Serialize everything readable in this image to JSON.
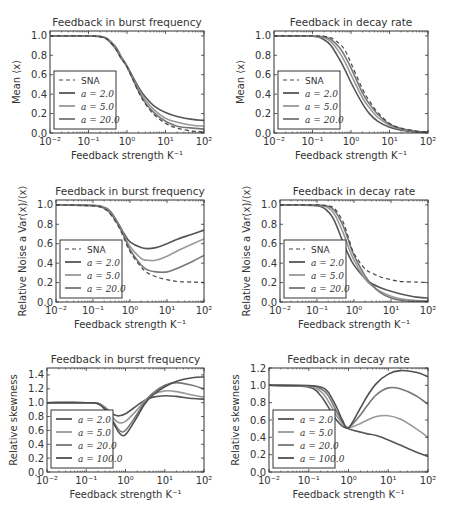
{
  "figure": {
    "width": 454,
    "height": 515,
    "colors": {
      "SNA": "#444444",
      "a2": "#555555",
      "a5": "#999999",
      "a20": "#777777",
      "a100": "#505050",
      "axis": "#333333"
    }
  },
  "chart_data": [
    {
      "id": "mean-burst",
      "type": "line",
      "title": "Feedback in burst frequency",
      "xlabel": "Feedback strength K⁻¹",
      "ylabel": "Mean ⟨x⟩",
      "xscale": "log",
      "xlim": [
        0.01,
        100
      ],
      "ylim": [
        0.0,
        1.05
      ],
      "xticks": [
        "10⁻²",
        "10⁻¹",
        "10⁰",
        "10¹",
        "10²"
      ],
      "yticks": [
        "0.0",
        "0.2",
        "0.4",
        "0.6",
        "0.8",
        "1.0"
      ],
      "legend": {
        "position": "lower left",
        "entries": [
          "SNA",
          "a = 2.0",
          "a = 5.0",
          "a = 20.0"
        ]
      },
      "x": [
        0.01,
        0.1,
        0.2,
        0.3,
        0.5,
        0.7,
        1,
        2,
        3,
        5,
        10,
        20,
        50,
        100
      ],
      "series": [
        {
          "name": "SNA",
          "style": "dashed",
          "values": [
            1.0,
            1.0,
            0.99,
            0.97,
            0.87,
            0.77,
            0.68,
            0.42,
            0.3,
            0.19,
            0.1,
            0.05,
            0.02,
            0.01
          ]
        },
        {
          "name": "a = 2.0",
          "style": "solid",
          "values": [
            1.0,
            1.0,
            0.995,
            0.975,
            0.89,
            0.79,
            0.69,
            0.47,
            0.37,
            0.28,
            0.21,
            0.17,
            0.14,
            0.13
          ]
        },
        {
          "name": "a = 5.0",
          "style": "solid",
          "values": [
            1.0,
            1.0,
            0.993,
            0.97,
            0.88,
            0.78,
            0.68,
            0.45,
            0.34,
            0.24,
            0.15,
            0.11,
            0.08,
            0.07
          ]
        },
        {
          "name": "a = 20.0",
          "style": "solid",
          "values": [
            1.0,
            1.0,
            0.99,
            0.965,
            0.87,
            0.77,
            0.68,
            0.43,
            0.31,
            0.21,
            0.12,
            0.07,
            0.05,
            0.04
          ]
        }
      ]
    },
    {
      "id": "mean-decay",
      "type": "line",
      "title": "Feedback in decay rate",
      "xlabel": "Feedback strength K⁻¹",
      "ylabel": "Mean ⟨x⟩",
      "xscale": "log",
      "xlim": [
        0.01,
        100
      ],
      "ylim": [
        0.0,
        1.05
      ],
      "xticks": [
        "10⁻²",
        "10⁻¹",
        "10⁰",
        "10¹",
        "10²"
      ],
      "yticks": [
        "0.0",
        "0.2",
        "0.4",
        "0.6",
        "0.8",
        "1.0"
      ],
      "legend": {
        "position": "lower left",
        "entries": [
          "SNA",
          "a = 2.0",
          "a = 5.0",
          "a = 20.0"
        ]
      },
      "x": [
        0.01,
        0.1,
        0.2,
        0.3,
        0.5,
        0.7,
        1,
        2,
        3,
        5,
        10,
        20,
        50,
        100
      ],
      "series": [
        {
          "name": "SNA",
          "style": "dashed",
          "values": [
            1.0,
            1.0,
            0.995,
            0.98,
            0.92,
            0.85,
            0.72,
            0.45,
            0.33,
            0.21,
            0.1,
            0.05,
            0.02,
            0.01
          ]
        },
        {
          "name": "a = 2.0",
          "style": "solid",
          "values": [
            1.0,
            0.995,
            0.96,
            0.9,
            0.76,
            0.65,
            0.52,
            0.3,
            0.2,
            0.12,
            0.06,
            0.03,
            0.01,
            0.005
          ]
        },
        {
          "name": "a = 5.0",
          "style": "solid",
          "values": [
            1.0,
            0.998,
            0.98,
            0.94,
            0.83,
            0.73,
            0.6,
            0.36,
            0.26,
            0.16,
            0.08,
            0.04,
            0.015,
            0.007
          ]
        },
        {
          "name": "a = 20.0",
          "style": "solid",
          "values": [
            1.0,
            0.999,
            0.99,
            0.965,
            0.88,
            0.79,
            0.67,
            0.41,
            0.3,
            0.19,
            0.09,
            0.045,
            0.018,
            0.008
          ]
        }
      ]
    },
    {
      "id": "noise-burst",
      "type": "line",
      "title": "Feedback in burst frequency",
      "xlabel": "Feedback strength K⁻¹",
      "ylabel": "Relative Noise a Var(x)/⟨x⟩",
      "xscale": "log",
      "xlim": [
        0.01,
        100
      ],
      "ylim": [
        0.0,
        1.05
      ],
      "xticks": [
        "10⁻²",
        "10⁻¹",
        "10⁰",
        "10¹",
        "10²"
      ],
      "yticks": [
        "0.0",
        "0.2",
        "0.4",
        "0.6",
        "0.8",
        "1.0"
      ],
      "legend": {
        "position": "lower left",
        "entries": [
          "SNA",
          "a = 2.0",
          "a = 5.0",
          "a = 20.0"
        ]
      },
      "x": [
        0.01,
        0.1,
        0.2,
        0.3,
        0.5,
        0.7,
        1,
        2,
        3,
        5,
        10,
        20,
        50,
        100
      ],
      "series": [
        {
          "name": "SNA",
          "style": "dashed",
          "values": [
            1.0,
            0.99,
            0.96,
            0.9,
            0.77,
            0.65,
            0.52,
            0.36,
            0.3,
            0.26,
            0.23,
            0.21,
            0.205,
            0.2
          ]
        },
        {
          "name": "a = 2.0",
          "style": "solid",
          "values": [
            1.0,
            0.995,
            0.975,
            0.93,
            0.8,
            0.7,
            0.62,
            0.56,
            0.55,
            0.56,
            0.6,
            0.65,
            0.7,
            0.74
          ]
        },
        {
          "name": "a = 5.0",
          "style": "solid",
          "values": [
            1.0,
            0.993,
            0.97,
            0.92,
            0.79,
            0.68,
            0.57,
            0.45,
            0.43,
            0.43,
            0.47,
            0.53,
            0.6,
            0.65
          ]
        },
        {
          "name": "a = 20.0",
          "style": "solid",
          "values": [
            1.0,
            0.99,
            0.965,
            0.91,
            0.78,
            0.67,
            0.54,
            0.38,
            0.33,
            0.31,
            0.31,
            0.35,
            0.42,
            0.48
          ]
        }
      ]
    },
    {
      "id": "noise-decay",
      "type": "line",
      "title": "Feedback in decay rate",
      "xlabel": "Feedback strength K⁻¹",
      "ylabel": "Relative Noise a Var(x)/⟨x⟩",
      "xscale": "log",
      "xlim": [
        0.01,
        100
      ],
      "ylim": [
        0.0,
        1.05
      ],
      "xticks": [
        "10⁻²",
        "10⁻¹",
        "10⁰",
        "10¹",
        "10²"
      ],
      "yticks": [
        "0.0",
        "0.2",
        "0.4",
        "0.6",
        "0.8",
        "1.0"
      ],
      "legend": {
        "position": "lower left",
        "entries": [
          "SNA",
          "a = 2.0",
          "a = 5.0",
          "a = 20.0"
        ]
      },
      "x": [
        0.01,
        0.1,
        0.2,
        0.3,
        0.5,
        0.7,
        1,
        2,
        3,
        5,
        10,
        20,
        50,
        100
      ],
      "series": [
        {
          "name": "SNA",
          "style": "dashed",
          "values": [
            1.0,
            1.0,
            0.99,
            0.96,
            0.83,
            0.67,
            0.5,
            0.34,
            0.3,
            0.26,
            0.23,
            0.21,
            0.205,
            0.2
          ]
        },
        {
          "name": "a = 2.0",
          "style": "solid",
          "values": [
            1.0,
            0.99,
            0.93,
            0.83,
            0.62,
            0.49,
            0.38,
            0.24,
            0.19,
            0.15,
            0.11,
            0.08,
            0.05,
            0.04
          ]
        },
        {
          "name": "a = 5.0",
          "style": "solid",
          "values": [
            1.0,
            0.995,
            0.97,
            0.9,
            0.72,
            0.57,
            0.43,
            0.24,
            0.17,
            0.11,
            0.06,
            0.03,
            0.015,
            0.01
          ]
        },
        {
          "name": "a = 20.0",
          "style": "solid",
          "values": [
            1.0,
            0.998,
            0.985,
            0.94,
            0.79,
            0.64,
            0.48,
            0.27,
            0.18,
            0.1,
            0.04,
            0.015,
            0.005,
            0.002
          ]
        }
      ]
    },
    {
      "id": "skew-burst",
      "type": "line",
      "title": "Feedback in burst frequency",
      "xlabel": "Feedback strength K⁻¹",
      "ylabel": "Relative skewness",
      "xscale": "log",
      "xlim": [
        0.01,
        100
      ],
      "ylim": [
        0.0,
        1.5
      ],
      "xticks": [
        "10⁻²",
        "10⁻¹",
        "10⁰",
        "10¹",
        "10²"
      ],
      "yticks": [
        "0.0",
        "0.2",
        "0.4",
        "0.6",
        "0.8",
        "1.0",
        "1.2",
        "1.4"
      ],
      "legend": {
        "position": "lower left",
        "entries": [
          "a = 2.0",
          "a = 5.0",
          "a = 20.0",
          "a = 100.0"
        ]
      },
      "x": [
        0.01,
        0.1,
        0.2,
        0.3,
        0.5,
        0.7,
        1,
        2,
        3,
        5,
        10,
        20,
        50,
        100
      ],
      "series": [
        {
          "name": "a = 2.0",
          "style": "solid",
          "values": [
            1.0,
            1.0,
            0.99,
            0.93,
            0.83,
            0.81,
            0.84,
            0.96,
            1.03,
            1.08,
            1.1,
            1.09,
            1.06,
            1.05
          ]
        },
        {
          "name": "a = 5.0",
          "style": "solid",
          "values": [
            1.0,
            1.0,
            0.99,
            0.92,
            0.77,
            0.71,
            0.73,
            0.9,
            1.02,
            1.12,
            1.17,
            1.16,
            1.11,
            1.08
          ]
        },
        {
          "name": "a = 20.0",
          "style": "solid",
          "values": [
            1.0,
            1.0,
            0.985,
            0.91,
            0.72,
            0.6,
            0.6,
            0.84,
            1.0,
            1.14,
            1.25,
            1.29,
            1.25,
            1.2
          ]
        },
        {
          "name": "a = 100.0",
          "style": "solid",
          "values": [
            1.0,
            1.0,
            0.985,
            0.9,
            0.7,
            0.56,
            0.54,
            0.8,
            0.97,
            1.11,
            1.23,
            1.31,
            1.36,
            1.37
          ]
        }
      ]
    },
    {
      "id": "skew-decay",
      "type": "line",
      "title": "Feedback in decay rate",
      "xlabel": "Feedback strength K⁻¹",
      "ylabel": "Relative skewness",
      "xscale": "log",
      "xlim": [
        0.01,
        100
      ],
      "ylim": [
        0.0,
        1.2
      ],
      "xticks": [
        "10⁻²",
        "10⁻¹",
        "10⁰",
        "10¹",
        "10²"
      ],
      "yticks": [
        "0.0",
        "0.2",
        "0.4",
        "0.6",
        "0.8",
        "1.0",
        "1.2"
      ],
      "legend": {
        "position": "lower left",
        "entries": [
          "a = 2.0",
          "a = 5.0",
          "a = 20.0",
          "a = 100.0"
        ]
      },
      "x": [
        0.01,
        0.1,
        0.2,
        0.3,
        0.5,
        0.7,
        1,
        2,
        3,
        5,
        10,
        20,
        50,
        100
      ],
      "series": [
        {
          "name": "a = 2.0",
          "style": "solid",
          "values": [
            1.0,
            0.98,
            0.88,
            0.76,
            0.6,
            0.53,
            0.5,
            0.46,
            0.44,
            0.42,
            0.37,
            0.31,
            0.23,
            0.18
          ]
        },
        {
          "name": "a = 5.0",
          "style": "solid",
          "values": [
            1.0,
            0.99,
            0.93,
            0.83,
            0.65,
            0.56,
            0.51,
            0.56,
            0.6,
            0.64,
            0.65,
            0.61,
            0.5,
            0.4
          ]
        },
        {
          "name": "a = 20.0",
          "style": "solid",
          "values": [
            1.0,
            0.995,
            0.96,
            0.89,
            0.7,
            0.58,
            0.51,
            0.66,
            0.77,
            0.89,
            0.97,
            0.96,
            0.88,
            0.78
          ]
        },
        {
          "name": "a = 100.0",
          "style": "solid",
          "values": [
            1.0,
            0.998,
            0.98,
            0.93,
            0.75,
            0.6,
            0.51,
            0.74,
            0.88,
            1.02,
            1.13,
            1.17,
            1.15,
            1.1
          ]
        }
      ]
    }
  ],
  "panels": [
    {
      "chart": 0,
      "box": [
        50,
        31,
        204,
        133
      ]
    },
    {
      "chart": 1,
      "box": [
        274,
        31,
        428,
        133
      ]
    },
    {
      "chart": 2,
      "box": [
        56,
        200,
        204,
        302
      ]
    },
    {
      "chart": 3,
      "box": [
        280,
        200,
        428,
        302
      ]
    },
    {
      "chart": 4,
      "box": [
        47,
        368,
        204,
        472
      ]
    },
    {
      "chart": 5,
      "box": [
        269,
        368,
        428,
        472
      ]
    }
  ]
}
